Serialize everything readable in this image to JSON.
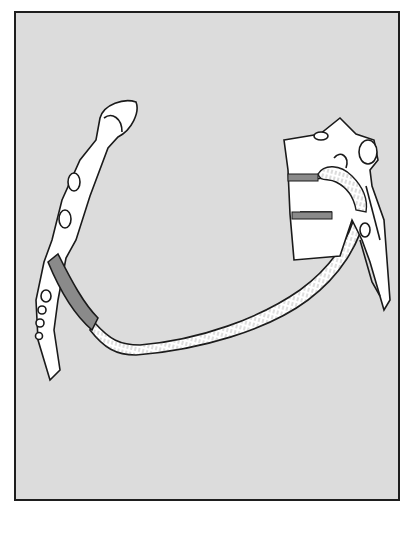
{
  "figure": {
    "type": "anatomical-illustration",
    "colors": {
      "background": "#dcdcdc",
      "frame": "#1e1e1e",
      "bone": "#ffffff",
      "outline": "#1a1a1a",
      "highlight": "#8a8a8a",
      "hatch": "#555555"
    },
    "parts": [
      {
        "name": "sternum"
      },
      {
        "name": "costal-cartilage-highlight"
      },
      {
        "name": "rib-shaft"
      },
      {
        "name": "vertebra"
      },
      {
        "name": "intervertebral-highlights",
        "count": 2
      },
      {
        "name": "spinous-processes",
        "count": 3
      }
    ]
  }
}
